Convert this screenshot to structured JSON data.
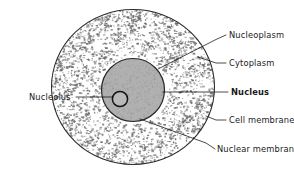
{
  "diagram": {
    "background_color": "#ffffff",
    "ink_color": "#1a1a1a"
  },
  "structures": {
    "cell": {
      "name": "Cell",
      "membrane_color": "#2b2b2b",
      "cytoplasm_fill": "#ffffff",
      "stipple_color": "#6f6f6f",
      "center": [
        133,
        87
      ],
      "radius_x": 82,
      "radius_y": 78
    },
    "nucleus": {
      "name": "Nucleus",
      "fill": "#b0b0b0",
      "membrane_color": "#262626",
      "center": [
        133,
        90
      ],
      "radius": 32
    },
    "nucleolus": {
      "name": "Nucleolus",
      "fill": "#b9b9b9",
      "outline_color": "#141414",
      "center": [
        120,
        99
      ],
      "radius": 8
    }
  },
  "labels": [
    {
      "id": "nucleoplasm",
      "text": "Nucleoplasm",
      "bold": false,
      "text_x": 229,
      "text_y": 38,
      "leader": [
        [
          226,
          35
        ],
        [
          217,
          39
        ],
        [
          158,
          69
        ]
      ]
    },
    {
      "id": "cytoplasm",
      "text": "Cytoplasm",
      "bold": false,
      "text_x": 229,
      "text_y": 66,
      "leader": [
        [
          226,
          63
        ],
        [
          216,
          63
        ],
        [
          198,
          57
        ]
      ]
    },
    {
      "id": "nucleus",
      "text": "Nucleus",
      "bold": true,
      "text_x": 231,
      "text_y": 95,
      "leader": [
        [
          228,
          92
        ],
        [
          163,
          92
        ]
      ]
    },
    {
      "id": "cell-membrane",
      "text": "Cell membrane",
      "bold": false,
      "text_x": 229,
      "text_y": 123,
      "leader": [
        [
          226,
          120
        ],
        [
          216,
          120
        ],
        [
          206,
          116
        ]
      ]
    },
    {
      "id": "nuclear-membrane",
      "text": "Nuclear membrane",
      "bold": false,
      "text_x": 217,
      "text_y": 152,
      "leader": [
        [
          215,
          149
        ],
        [
          206,
          143
        ],
        [
          140,
          119
        ]
      ]
    },
    {
      "id": "nucleolus",
      "text": "Nucleolus",
      "bold": false,
      "text_x": 29,
      "text_y": 100,
      "leader": [
        [
          76,
          97
        ],
        [
          112,
          97
        ]
      ]
    }
  ]
}
